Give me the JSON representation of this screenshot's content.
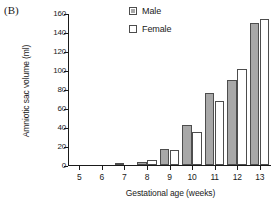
{
  "panel": {
    "label": "(B)"
  },
  "legend": {
    "position": "top-center",
    "entries": [
      {
        "label": "Male",
        "swatch": "filled-gray-square-icon",
        "color": "#a8a8a8"
      },
      {
        "label": "Female",
        "swatch": "empty-white-square-icon",
        "color": "#ffffff"
      }
    ]
  },
  "chart_data": {
    "type": "bar",
    "title": "",
    "subtitle": "",
    "xlabel": "Gestational age (weeks)",
    "ylabel": "Amniotic sac volume (ml)",
    "categories": [
      "5",
      "6",
      "7",
      "8",
      "9",
      "10",
      "11",
      "12",
      "13"
    ],
    "series": [
      {
        "name": "Male",
        "color": "#a8a8a8",
        "values": [
          0,
          0,
          2,
          3,
          17,
          42,
          76,
          89,
          150
        ]
      },
      {
        "name": "Female",
        "color": "#ffffff",
        "values": [
          0,
          0,
          0,
          5,
          16,
          35,
          67,
          101,
          154
        ]
      }
    ],
    "ylim": [
      0,
      160
    ],
    "yticks": [
      0,
      20,
      40,
      60,
      80,
      100,
      120,
      140,
      160
    ],
    "ytick_labels": [
      "0",
      "20",
      "40",
      "60",
      "80",
      "100",
      "120",
      "140",
      "160"
    ],
    "xtick_labels": [
      "5",
      "6",
      "7",
      "8",
      "9",
      "10",
      "11",
      "12",
      "13"
    ],
    "grid": false,
    "legend_position": "top-center"
  },
  "colors": {
    "axis": "#1a1a1a",
    "bar_male_fill": "#a8a8a8",
    "bar_female_fill": "#ffffff",
    "bar_edge": "#4d4d4d",
    "background": "#ffffff"
  }
}
